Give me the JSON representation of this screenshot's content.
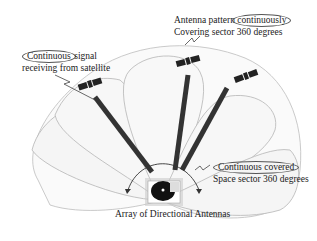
{
  "diagram": {
    "labels": {
      "top_right": {
        "line1_prefix": "Antenna pattern",
        "line1_highlight": "continuously",
        "line2": "Covering sector 360 degrees"
      },
      "top_left": {
        "line1_highlight": "Continuous",
        "line1_suffix": "signal",
        "line2": "receiving from satellite"
      },
      "right": {
        "line1_highlight": "Continuous covered",
        "line2": "Space sector 360 degrees"
      },
      "bottom": "Array of Directional Antennas"
    },
    "elements": {
      "satellites": 3,
      "antenna_beams": 3,
      "antenna_lobes": 5
    },
    "colors": {
      "lobe_stroke": "#b5b5b5",
      "lobe_fill": "#f7f7f7",
      "beam": "#333333",
      "text": "#222222",
      "oval": "#555555"
    }
  }
}
